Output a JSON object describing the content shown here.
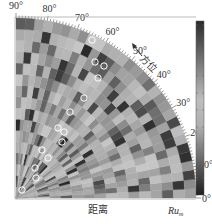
{
  "chart_data": {
    "type": "heatmap",
    "projection": "polar-quarter",
    "title": "",
    "angle_axis": {
      "label": "方位",
      "ticks": [
        "0°",
        "10°",
        "20°",
        "30°",
        "40°",
        "50°",
        "60°",
        "70°",
        "80°",
        "90°"
      ],
      "range": [
        0,
        90
      ]
    },
    "radial_axis": {
      "label": "距离",
      "end_label": "Ru",
      "end_label_sub": "m"
    },
    "colorbar": {
      "present": true,
      "orientation": "vertical",
      "gradient": [
        "#2a2a2a",
        "#bdbdbd",
        "#1e1e1e"
      ]
    },
    "grid": {
      "rings": 16,
      "sectors": 30
    },
    "markers": {
      "type": "open-circle",
      "color": "#ffffff",
      "count": 14
    },
    "colors": {
      "background": "#9a9a9a",
      "frame": "#888888",
      "text": "#333333"
    }
  },
  "labels": {
    "direction_label": "方位",
    "distance_label": "距离",
    "ru_label": "Ru",
    "ru_sub": "m"
  }
}
